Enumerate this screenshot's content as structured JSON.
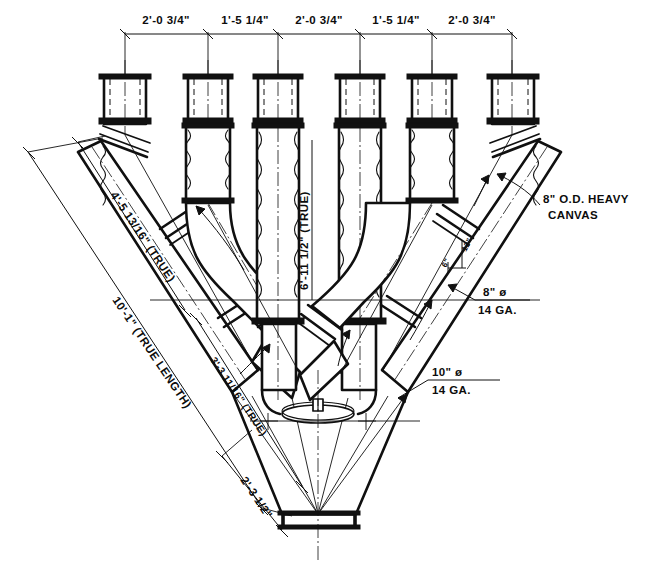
{
  "drawing": {
    "title": "Six-Branch Duct Manifold Fabrication Drawing",
    "ink_color": "#101010",
    "paper_color": "#ffffff"
  },
  "top_dimension_chain": {
    "name": "top-dimension-chain",
    "segments": [
      {
        "label": "2'-0",
        "fraction": "3/4",
        "unit": "\"",
        "full": "2'-0 3/4\""
      },
      {
        "label": "1'-5",
        "fraction": "1/4",
        "unit": "\"",
        "full": "1'-5 1/4\""
      },
      {
        "label": "2'-0",
        "fraction": "3/4",
        "unit": "\"",
        "full": "2'-0 3/4\""
      },
      {
        "label": "1'-5",
        "fraction": "1/4",
        "unit": "\"",
        "full": "1'-5 1/4\""
      },
      {
        "label": "2'-0",
        "fraction": "3/4",
        "unit": "\"",
        "full": "2'-0 3/4\""
      }
    ]
  },
  "diagonal_dimensions": {
    "upper_left_branch": {
      "label": "4'-5",
      "fraction": "13/16",
      "unit": "\"",
      "note": "(TRUE)",
      "full": "4'-5 13/16\" (TRUE)"
    },
    "outer_left_overall": {
      "label": "10'-1",
      "fraction": "",
      "unit": "\"",
      "note": "(TRUE LENGTH)",
      "full": "10'-1\" (TRUE LENGTH)"
    },
    "inner_left_branch": {
      "label": "3'-3",
      "fraction": "11/16",
      "unit": "\"",
      "note": "(TRUE)",
      "full": "3'-3 11/16\" (TRUE)"
    },
    "lower_left_short": {
      "label": "2'-3",
      "fraction": "1/2",
      "unit": "\"",
      "note": "",
      "full": "2'-3 1/2\""
    },
    "center_vertical": {
      "label": "6'-11",
      "fraction": "1/2",
      "unit": "\"",
      "note": "(TRUE)",
      "full": "6'-11 1/2\" (TRUE)"
    }
  },
  "callouts": {
    "canvas": {
      "line1": "8\" O.D. HEAVY",
      "line2": "CANVAS"
    },
    "eight_inch": {
      "line1": "8\" ø",
      "line2": "14 GA."
    },
    "ten_inch": {
      "line1": "10\" ø",
      "line2": "14 GA."
    }
  },
  "slope_notes": {
    "rise": "12\"",
    "run": "6\""
  },
  "branches": {
    "count": 6,
    "top_x_positions": [
      125,
      208,
      278,
      360,
      432,
      512
    ]
  }
}
